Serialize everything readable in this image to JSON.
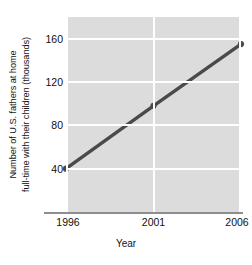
{
  "chart_data": {
    "type": "line",
    "title": "",
    "xlabel": "Year",
    "ylabel_line1": "Number of U.S. fathers at home",
    "ylabel_line2": "full-time with their children (thousands)",
    "x": [
      1996,
      2001,
      2006
    ],
    "values": [
      40,
      98,
      155
    ],
    "xtick_labels": [
      "1996",
      "2001",
      "2006"
    ],
    "ytick_labels": [
      "160",
      "120",
      "80",
      "40"
    ],
    "ytick_values": [
      160,
      120,
      80,
      40
    ],
    "xlim": [
      1996,
      2006
    ],
    "ylim": [
      0,
      180
    ],
    "grid": true,
    "grid_color": "#ffffff",
    "plot_background": "#dcdcdc",
    "series_color": "#4a4a4a",
    "marker": "circle",
    "legend": "none",
    "series": [
      {
        "name": "U.S. stay-at-home fathers",
        "values": [
          40,
          98,
          155
        ]
      }
    ]
  }
}
